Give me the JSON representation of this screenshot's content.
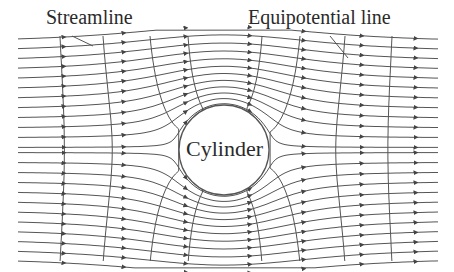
{
  "diagram": {
    "labels": {
      "streamline": "Streamline",
      "equipotential": "Equipotential line",
      "cylinder": "Cylinder"
    },
    "colors": {
      "line": "#555555",
      "arrow": "#444444",
      "text": "#2a2a2a",
      "background": "#ffffff"
    },
    "cylinder": {
      "cx": 224,
      "cy": 150,
      "r": 45
    },
    "flow": {
      "U": 1,
      "x_min": 18,
      "x_max": 440,
      "y_min": 36,
      "y_max": 262,
      "streamline_count_per_side": 12
    },
    "equipotential_x": [
      60,
      103,
      150,
      188,
      262,
      300,
      345,
      392
    ],
    "arrow_columns_x": [
      58,
      118,
      180,
      244,
      298,
      356,
      410
    ]
  }
}
